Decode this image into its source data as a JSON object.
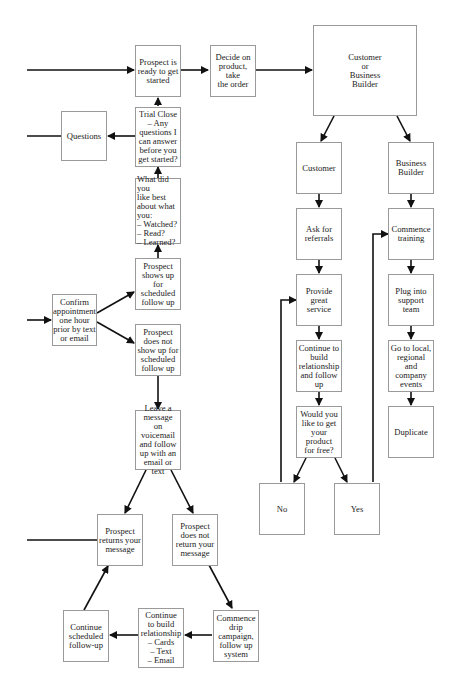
{
  "boxes": {
    "ready": "Prospect is\nready to get\nstarted",
    "decide": "Decide on\nproduct,\ntake\nthe order",
    "cust_or_bb": "Customer\nor\nBusiness\nBuilder",
    "questions": "Questions",
    "trial_close": "Trial Close\n– Any\nquestions I\ncan answer\nbefore you\nget started?",
    "liked_best": "What did you\nlike best\nabout what\nyou:\n– Watched?\n– Read?\n– Learned?",
    "shows_up": "Prospect\nshows up\nfor\nscheduled\nfollow up",
    "confirm": "Confirm\nappointment\none hour\nprior by text\nor email",
    "no_show": "Prospect\ndoes not\nshow up for\nscheduled\nfollow up",
    "voicemail": "Leave a\nmessage\non voicemail\nand follow\nup with an\nemail or text",
    "returns": "Prospect\nreturns your\nmessage",
    "not_return": "Prospect\ndoes not\nreturn your\nmessage",
    "continue_sched": "Continue\nscheduled\nfollow-up",
    "continue_build": "Continue\nto build\nrelationship\n– Cards\n– Text\n– Email",
    "drip": "Commence\ndrip\ncampaign,\nfollow up\nsystem",
    "customer": "Customer",
    "business_builder": "Business\nBuilder",
    "referrals": "Ask for\nreferrals",
    "great_service": "Provide\ngreat\nservice",
    "continue_rel": "Continue to\nbuild\nrelationship\nand follow\nup",
    "free_product": "Would you\nlike to get\nyour\nproduct\nfor free?",
    "no": "No",
    "yes": "Yes",
    "training": "Commence\ntraining",
    "support": "Plug into\nsupport\nteam",
    "events": "Go to local,\nregional and\ncompany\nevents",
    "duplicate": "Duplicate"
  }
}
